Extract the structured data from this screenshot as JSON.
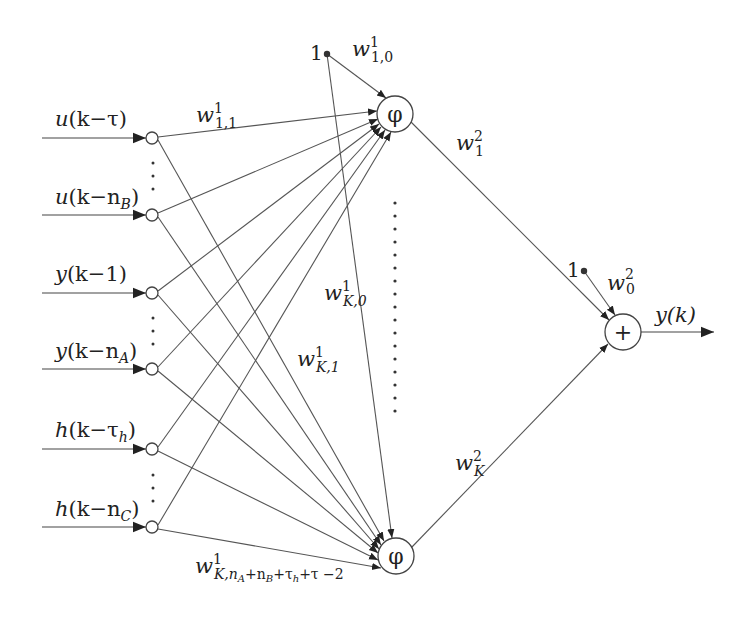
{
  "diagram": {
    "type": "neural-network",
    "inputs": [
      {
        "id": "in1",
        "label": "u(k−τ)",
        "parts": {
          "fn": "u",
          "arg": "(k−τ)"
        },
        "y": 138
      },
      {
        "id": "in2",
        "label": "u(k−n_B)",
        "parts": {
          "fn": "u",
          "arg": "(k−n",
          "sub": "B",
          "close": ")"
        },
        "y": 215
      },
      {
        "id": "in3",
        "label": "y(k−1)",
        "parts": {
          "fn": "y",
          "arg": "(k−1)"
        },
        "y": 293
      },
      {
        "id": "in4",
        "label": "y(k−n_A)",
        "parts": {
          "fn": "y",
          "arg": "(k−n",
          "sub": "A",
          "close": ")"
        },
        "y": 369
      },
      {
        "id": "in5",
        "label": "h(k−τ_h)",
        "parts": {
          "fn": "h",
          "arg": "(k−τ",
          "sub": "h",
          "close": ")"
        },
        "y": 449
      },
      {
        "id": "in6",
        "label": "h(k−n_C)",
        "parts": {
          "fn": "h",
          "arg": "(k−n",
          "sub": "C",
          "close": ")"
        },
        "y": 527
      }
    ],
    "hidden_nodes": [
      {
        "id": "h1",
        "symbol": "φ",
        "cx": 395,
        "cy": 114
      },
      {
        "id": "hK",
        "symbol": "φ",
        "cx": 396,
        "cy": 556
      }
    ],
    "output_node": {
      "id": "out",
      "symbol": "+",
      "cx": 623,
      "cy": 332,
      "output_label": "y(k)"
    },
    "bias_inputs": [
      {
        "id": "bias1",
        "label": "1",
        "x": 327,
        "y": 54
      },
      {
        "id": "bias2",
        "label": "1",
        "x": 584,
        "y": 271
      }
    ],
    "weights": {
      "w1_10": {
        "base": "w",
        "sup": "1",
        "sub": "1,0"
      },
      "w1_11": {
        "base": "w",
        "sup": "1",
        "sub": "1,1"
      },
      "w1_K0": {
        "base": "w",
        "sup": "1",
        "sub": "K,0"
      },
      "w1_K1": {
        "base": "w",
        "sup": "1",
        "sub": "K,1"
      },
      "w1_last": {
        "base": "w",
        "sup": "1",
        "sub": "K,n",
        "sub2": "A",
        "sub3": "+n",
        "sub4": "B",
        "sub5": "+τ",
        "sub6": "h",
        "sub7": "+τ −2"
      },
      "w2_1": {
        "base": "w",
        "sup": "2",
        "sub": "1"
      },
      "w2_K": {
        "base": "w",
        "sup": "2",
        "sub": "K"
      },
      "w2_0": {
        "base": "w",
        "sup": "2",
        "sub": "0"
      }
    },
    "ellipsis": "⋮"
  }
}
